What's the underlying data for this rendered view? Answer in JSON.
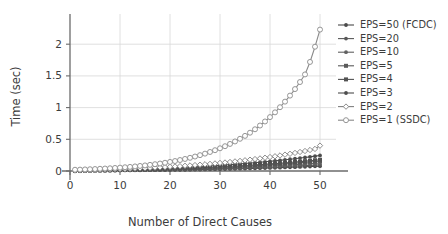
{
  "chart_data": {
    "type": "line",
    "title": "",
    "xlabel": "Number of Direct Causes",
    "ylabel": "Time (sec)",
    "xlim": [
      0,
      52
    ],
    "ylim": [
      0,
      2.35
    ],
    "xticks": [
      "0",
      "10",
      "20",
      "30",
      "40",
      "50"
    ],
    "xtick_values": [
      0,
      10,
      20,
      30,
      40,
      50
    ],
    "yticks": [
      "0",
      "0.5",
      "1",
      "1.5",
      "2"
    ],
    "ytick_values": [
      0,
      0.5,
      1,
      1.5,
      2
    ],
    "grid": true,
    "legend_position": "right",
    "x": [
      1,
      2,
      3,
      4,
      5,
      6,
      7,
      8,
      9,
      10,
      11,
      12,
      13,
      14,
      15,
      16,
      17,
      18,
      19,
      20,
      21,
      22,
      23,
      24,
      25,
      26,
      27,
      28,
      29,
      30,
      31,
      32,
      33,
      34,
      35,
      36,
      37,
      38,
      39,
      40,
      41,
      42,
      43,
      44,
      45,
      46,
      47,
      48,
      49,
      50
    ],
    "series": [
      {
        "name": "EPS=50 (FCDC)",
        "color": "#4a4a4a",
        "marker": "filled-circle",
        "values": [
          0.004,
          0.005,
          0.005,
          0.006,
          0.006,
          0.007,
          0.007,
          0.008,
          0.008,
          0.009,
          0.01,
          0.01,
          0.011,
          0.012,
          0.013,
          0.013,
          0.014,
          0.015,
          0.016,
          0.017,
          0.018,
          0.019,
          0.02,
          0.021,
          0.022,
          0.024,
          0.025,
          0.026,
          0.028,
          0.029,
          0.031,
          0.032,
          0.034,
          0.036,
          0.038,
          0.04,
          0.042,
          0.044,
          0.046,
          0.048,
          0.051,
          0.053,
          0.056,
          0.058,
          0.061,
          0.064,
          0.067,
          0.07,
          0.073,
          0.076
        ]
      },
      {
        "name": "EPS=20",
        "color": "#585858",
        "marker": "filled-circle",
        "values": [
          0.005,
          0.005,
          0.006,
          0.006,
          0.007,
          0.008,
          0.008,
          0.009,
          0.01,
          0.011,
          0.011,
          0.012,
          0.013,
          0.014,
          0.015,
          0.016,
          0.017,
          0.018,
          0.019,
          0.021,
          0.022,
          0.023,
          0.025,
          0.026,
          0.028,
          0.029,
          0.031,
          0.033,
          0.035,
          0.037,
          0.039,
          0.041,
          0.043,
          0.045,
          0.048,
          0.05,
          0.053,
          0.056,
          0.058,
          0.061,
          0.064,
          0.068,
          0.071,
          0.074,
          0.078,
          0.082,
          0.085,
          0.089,
          0.093,
          0.097
        ]
      },
      {
        "name": "EPS=10",
        "color": "#616161",
        "marker": "filled-circle",
        "values": [
          0.005,
          0.006,
          0.007,
          0.007,
          0.008,
          0.009,
          0.01,
          0.011,
          0.012,
          0.013,
          0.014,
          0.015,
          0.016,
          0.017,
          0.019,
          0.02,
          0.021,
          0.023,
          0.024,
          0.026,
          0.028,
          0.029,
          0.031,
          0.033,
          0.035,
          0.037,
          0.04,
          0.042,
          0.044,
          0.047,
          0.05,
          0.052,
          0.055,
          0.058,
          0.061,
          0.065,
          0.068,
          0.071,
          0.075,
          0.079,
          0.083,
          0.087,
          0.091,
          0.095,
          0.1,
          0.105,
          0.11,
          0.115,
          0.12,
          0.125
        ]
      },
      {
        "name": "EPS=5",
        "color": "#5a5a5a",
        "marker": "filled-square",
        "values": [
          0.006,
          0.007,
          0.008,
          0.009,
          0.01,
          0.011,
          0.012,
          0.013,
          0.014,
          0.015,
          0.017,
          0.018,
          0.019,
          0.021,
          0.023,
          0.024,
          0.026,
          0.028,
          0.03,
          0.032,
          0.034,
          0.036,
          0.038,
          0.041,
          0.043,
          0.046,
          0.049,
          0.052,
          0.055,
          0.058,
          0.061,
          0.064,
          0.068,
          0.072,
          0.076,
          0.08,
          0.084,
          0.088,
          0.093,
          0.098,
          0.103,
          0.108,
          0.113,
          0.119,
          0.124,
          0.13,
          0.136,
          0.143,
          0.149,
          0.156
        ]
      },
      {
        "name": "EPS=4",
        "color": "#525252",
        "marker": "filled-square",
        "values": [
          0.006,
          0.007,
          0.008,
          0.009,
          0.011,
          0.012,
          0.013,
          0.014,
          0.016,
          0.017,
          0.019,
          0.02,
          0.022,
          0.024,
          0.026,
          0.028,
          0.03,
          0.032,
          0.034,
          0.036,
          0.039,
          0.041,
          0.044,
          0.047,
          0.05,
          0.053,
          0.056,
          0.059,
          0.063,
          0.066,
          0.07,
          0.074,
          0.078,
          0.082,
          0.087,
          0.091,
          0.096,
          0.101,
          0.106,
          0.112,
          0.117,
          0.123,
          0.129,
          0.135,
          0.142,
          0.148,
          0.155,
          0.162,
          0.17,
          0.177
        ]
      },
      {
        "name": "EPS=3",
        "color": "#4d4d4d",
        "marker": "filled-circle",
        "values": [
          0.007,
          0.008,
          0.01,
          0.011,
          0.013,
          0.014,
          0.016,
          0.018,
          0.02,
          0.022,
          0.024,
          0.026,
          0.028,
          0.031,
          0.033,
          0.036,
          0.039,
          0.042,
          0.045,
          0.048,
          0.052,
          0.055,
          0.059,
          0.063,
          0.067,
          0.071,
          0.076,
          0.08,
          0.085,
          0.09,
          0.095,
          0.101,
          0.106,
          0.112,
          0.118,
          0.125,
          0.131,
          0.138,
          0.145,
          0.153,
          0.16,
          0.168,
          0.177,
          0.185,
          0.194,
          0.204,
          0.213,
          0.223,
          0.234,
          0.245
        ]
      },
      {
        "name": "EPS=2",
        "color": "#808080",
        "marker": "open-diamond",
        "values": [
          0.008,
          0.01,
          0.012,
          0.014,
          0.016,
          0.018,
          0.021,
          0.023,
          0.026,
          0.029,
          0.032,
          0.035,
          0.038,
          0.042,
          0.045,
          0.049,
          0.053,
          0.057,
          0.062,
          0.066,
          0.071,
          0.076,
          0.082,
          0.087,
          0.093,
          0.099,
          0.106,
          0.112,
          0.119,
          0.127,
          0.134,
          0.142,
          0.151,
          0.159,
          0.169,
          0.178,
          0.188,
          0.198,
          0.209,
          0.22,
          0.232,
          0.245,
          0.258,
          0.271,
          0.285,
          0.3,
          0.315,
          0.331,
          0.348,
          0.4
        ]
      },
      {
        "name": "EPS=1 (SSDC)",
        "color": "#8a8a8a",
        "marker": "open-circle",
        "values": [
          0.02,
          0.022,
          0.025,
          0.028,
          0.031,
          0.035,
          0.039,
          0.043,
          0.048,
          0.053,
          0.059,
          0.065,
          0.072,
          0.08,
          0.088,
          0.097,
          0.107,
          0.118,
          0.13,
          0.143,
          0.157,
          0.173,
          0.19,
          0.208,
          0.228,
          0.25,
          0.274,
          0.3,
          0.328,
          0.358,
          0.391,
          0.427,
          0.466,
          0.508,
          0.554,
          0.604,
          0.658,
          0.717,
          0.781,
          0.85,
          0.925,
          1.006,
          1.094,
          1.189,
          1.292,
          1.403,
          1.523,
          1.72,
          1.96,
          2.23
        ]
      }
    ]
  }
}
